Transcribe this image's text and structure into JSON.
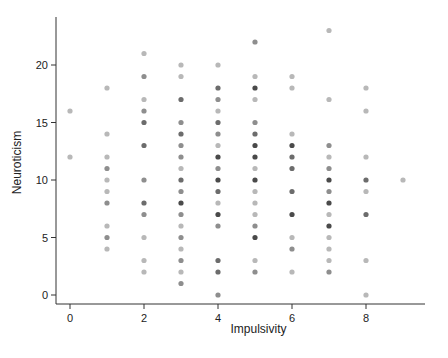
{
  "chart_data": {
    "type": "scatter",
    "title": "",
    "xlabel": "Impulsivity",
    "ylabel": "Neuroticism",
    "xlim": [
      -0.4,
      9.6
    ],
    "ylim": [
      -0.8,
      24.2
    ],
    "xticks": [
      0,
      2,
      4,
      6,
      8
    ],
    "yticks": [
      0,
      5,
      10,
      15,
      20
    ],
    "xtick_labels": [
      "0",
      "2",
      "4",
      "6",
      "8"
    ],
    "ytick_labels": [
      "0",
      "5",
      "10",
      "15",
      "20"
    ],
    "grid": false,
    "legend": null,
    "point_color": "#000000",
    "point_alpha_note": "darker points indicate overlapping observations",
    "points": [
      {
        "x": 0,
        "y": 16,
        "n": 1
      },
      {
        "x": 0,
        "y": 12,
        "n": 1
      },
      {
        "x": 1,
        "y": 18,
        "n": 1
      },
      {
        "x": 1,
        "y": 14,
        "n": 1
      },
      {
        "x": 1,
        "y": 12,
        "n": 1
      },
      {
        "x": 1,
        "y": 11,
        "n": 2
      },
      {
        "x": 1,
        "y": 10,
        "n": 1
      },
      {
        "x": 1,
        "y": 9,
        "n": 1
      },
      {
        "x": 1,
        "y": 8,
        "n": 2
      },
      {
        "x": 1,
        "y": 6,
        "n": 1
      },
      {
        "x": 1,
        "y": 5,
        "n": 2
      },
      {
        "x": 1,
        "y": 4,
        "n": 1
      },
      {
        "x": 2,
        "y": 21,
        "n": 1
      },
      {
        "x": 2,
        "y": 19,
        "n": 2
      },
      {
        "x": 2,
        "y": 17,
        "n": 1
      },
      {
        "x": 2,
        "y": 16,
        "n": 2
      },
      {
        "x": 2,
        "y": 15,
        "n": 3
      },
      {
        "x": 2,
        "y": 13,
        "n": 3
      },
      {
        "x": 2,
        "y": 10,
        "n": 2
      },
      {
        "x": 2,
        "y": 8,
        "n": 3
      },
      {
        "x": 2,
        "y": 7,
        "n": 2
      },
      {
        "x": 2,
        "y": 5,
        "n": 1
      },
      {
        "x": 2,
        "y": 3,
        "n": 1
      },
      {
        "x": 2,
        "y": 2,
        "n": 1
      },
      {
        "x": 3,
        "y": 20,
        "n": 1
      },
      {
        "x": 3,
        "y": 19,
        "n": 1
      },
      {
        "x": 3,
        "y": 17,
        "n": 3
      },
      {
        "x": 3,
        "y": 15,
        "n": 2
      },
      {
        "x": 3,
        "y": 14,
        "n": 3
      },
      {
        "x": 3,
        "y": 13,
        "n": 2
      },
      {
        "x": 3,
        "y": 12,
        "n": 2
      },
      {
        "x": 3,
        "y": 11,
        "n": 1
      },
      {
        "x": 3,
        "y": 10,
        "n": 3
      },
      {
        "x": 3,
        "y": 9,
        "n": 2
      },
      {
        "x": 3,
        "y": 8,
        "n": 4
      },
      {
        "x": 3,
        "y": 7,
        "n": 2
      },
      {
        "x": 3,
        "y": 6,
        "n": 1
      },
      {
        "x": 3,
        "y": 5,
        "n": 2
      },
      {
        "x": 3,
        "y": 4,
        "n": 1
      },
      {
        "x": 3,
        "y": 3,
        "n": 2
      },
      {
        "x": 3,
        "y": 2,
        "n": 1
      },
      {
        "x": 3,
        "y": 1,
        "n": 2
      },
      {
        "x": 4,
        "y": 20,
        "n": 1
      },
      {
        "x": 4,
        "y": 18,
        "n": 3
      },
      {
        "x": 4,
        "y": 17,
        "n": 2
      },
      {
        "x": 4,
        "y": 16,
        "n": 1
      },
      {
        "x": 4,
        "y": 15,
        "n": 3
      },
      {
        "x": 4,
        "y": 14,
        "n": 2
      },
      {
        "x": 4,
        "y": 13,
        "n": 1
      },
      {
        "x": 4,
        "y": 12,
        "n": 4
      },
      {
        "x": 4,
        "y": 11,
        "n": 2
      },
      {
        "x": 4,
        "y": 10,
        "n": 4
      },
      {
        "x": 4,
        "y": 9,
        "n": 3
      },
      {
        "x": 4,
        "y": 8,
        "n": 1
      },
      {
        "x": 4,
        "y": 7,
        "n": 4
      },
      {
        "x": 4,
        "y": 6,
        "n": 2
      },
      {
        "x": 4,
        "y": 3,
        "n": 3
      },
      {
        "x": 4,
        "y": 2,
        "n": 3
      },
      {
        "x": 4,
        "y": 0,
        "n": 2
      },
      {
        "x": 5,
        "y": 22,
        "n": 2
      },
      {
        "x": 5,
        "y": 19,
        "n": 1
      },
      {
        "x": 5,
        "y": 18,
        "n": 4
      },
      {
        "x": 5,
        "y": 17,
        "n": 1
      },
      {
        "x": 5,
        "y": 15,
        "n": 2
      },
      {
        "x": 5,
        "y": 14,
        "n": 3
      },
      {
        "x": 5,
        "y": 13,
        "n": 4
      },
      {
        "x": 5,
        "y": 12,
        "n": 4
      },
      {
        "x": 5,
        "y": 11,
        "n": 1
      },
      {
        "x": 5,
        "y": 10,
        "n": 4
      },
      {
        "x": 5,
        "y": 9,
        "n": 1
      },
      {
        "x": 5,
        "y": 8,
        "n": 1
      },
      {
        "x": 5,
        "y": 7,
        "n": 1
      },
      {
        "x": 5,
        "y": 6,
        "n": 2
      },
      {
        "x": 5,
        "y": 5,
        "n": 4
      },
      {
        "x": 5,
        "y": 3,
        "n": 1
      },
      {
        "x": 5,
        "y": 2,
        "n": 2
      },
      {
        "x": 6,
        "y": 19,
        "n": 1
      },
      {
        "x": 6,
        "y": 18,
        "n": 1
      },
      {
        "x": 6,
        "y": 14,
        "n": 1
      },
      {
        "x": 6,
        "y": 13,
        "n": 4
      },
      {
        "x": 6,
        "y": 12,
        "n": 3
      },
      {
        "x": 6,
        "y": 11,
        "n": 3
      },
      {
        "x": 6,
        "y": 9,
        "n": 3
      },
      {
        "x": 6,
        "y": 7,
        "n": 4
      },
      {
        "x": 6,
        "y": 5,
        "n": 1
      },
      {
        "x": 6,
        "y": 4,
        "n": 2
      },
      {
        "x": 6,
        "y": 2,
        "n": 1
      },
      {
        "x": 7,
        "y": 23,
        "n": 1
      },
      {
        "x": 7,
        "y": 17,
        "n": 1
      },
      {
        "x": 7,
        "y": 13,
        "n": 2
      },
      {
        "x": 7,
        "y": 12,
        "n": 1
      },
      {
        "x": 7,
        "y": 11,
        "n": 2
      },
      {
        "x": 7,
        "y": 10,
        "n": 4
      },
      {
        "x": 7,
        "y": 9,
        "n": 2
      },
      {
        "x": 7,
        "y": 8,
        "n": 4
      },
      {
        "x": 7,
        "y": 7,
        "n": 1
      },
      {
        "x": 7,
        "y": 6,
        "n": 4
      },
      {
        "x": 7,
        "y": 5,
        "n": 1
      },
      {
        "x": 7,
        "y": 4,
        "n": 1
      },
      {
        "x": 7,
        "y": 3,
        "n": 1
      },
      {
        "x": 7,
        "y": 2,
        "n": 2
      },
      {
        "x": 8,
        "y": 18,
        "n": 1
      },
      {
        "x": 8,
        "y": 16,
        "n": 1
      },
      {
        "x": 8,
        "y": 12,
        "n": 1
      },
      {
        "x": 8,
        "y": 10,
        "n": 3
      },
      {
        "x": 8,
        "y": 9,
        "n": 1
      },
      {
        "x": 8,
        "y": 7,
        "n": 3
      },
      {
        "x": 8,
        "y": 3,
        "n": 1
      },
      {
        "x": 8,
        "y": 0,
        "n": 1
      },
      {
        "x": 9,
        "y": 10,
        "n": 1
      }
    ]
  }
}
